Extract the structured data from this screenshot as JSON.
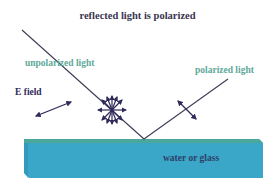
{
  "title": "reflected light is polarized",
  "labels": {
    "unpolarized": "unpolarized light",
    "polarized": "polarized light",
    "efield": "E field",
    "medium": "water or glass"
  },
  "colors": {
    "title_text": "#3a3550",
    "ray": "#3b3b55",
    "arrows": "#2f2a5a",
    "light_label": "#5ea99a",
    "slab_top": "#4aa89a",
    "slab_body": "#3aa6c8",
    "slab_dark": "#2f93b5"
  },
  "icons": {
    "efield_arrow": "double-headed-arrow",
    "unpolarized_symbol": "starburst-arrows",
    "polarized_arrow": "double-headed-arrow"
  }
}
